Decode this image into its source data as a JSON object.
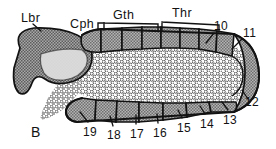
{
  "figure": {
    "panel_label": "B",
    "type": "anatomical-diagram",
    "background_color": "#ffffff",
    "ink_color": "#121212"
  },
  "region_labels": [
    {
      "id": "lbr",
      "text": "Lbr",
      "x": 21,
      "y": 18,
      "bracket": false
    },
    {
      "id": "cph",
      "text": "Cph",
      "x": 77,
      "y": 26,
      "bracket": true
    },
    {
      "id": "gth",
      "text": "Gth",
      "x": 111,
      "y": 17,
      "bracket": true
    },
    {
      "id": "thr",
      "text": "Thr",
      "x": 169,
      "y": 15,
      "bracket": true
    }
  ],
  "segment_numbers_top": [
    {
      "id": "n10",
      "text": "10",
      "x": 215,
      "y": 28
    },
    {
      "id": "n11",
      "text": "11",
      "x": 243,
      "y": 35
    }
  ],
  "segment_numbers_right": [
    {
      "id": "n12",
      "text": "12",
      "x": 247,
      "y": 103
    }
  ],
  "segment_numbers_bottom": [
    {
      "id": "n19",
      "text": "19",
      "x": 86,
      "y": 127
    },
    {
      "id": "n18",
      "text": "18",
      "x": 111,
      "y": 131
    },
    {
      "id": "n17",
      "text": "17",
      "x": 134,
      "y": 129
    },
    {
      "id": "n16",
      "text": "16",
      "x": 156,
      "y": 128
    },
    {
      "id": "n15",
      "text": "15",
      "x": 180,
      "y": 123
    },
    {
      "id": "n14",
      "text": "14",
      "x": 203,
      "y": 119
    },
    {
      "id": "n13",
      "text": "13",
      "x": 226,
      "y": 114
    }
  ],
  "colors": {
    "outline": "#121212",
    "segment_gray": "#9a9a9a",
    "head_gray": "#8e8e8e",
    "head_light": "#dcdcdc",
    "stipple_fill": "#ffffff",
    "stipple_dot": "#4a4a4a"
  },
  "counts": {
    "top_segments": 8,
    "bottom_segments": 7
  }
}
